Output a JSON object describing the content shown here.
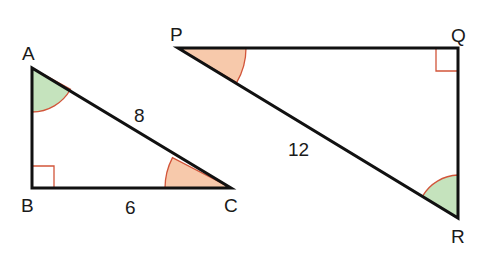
{
  "triangles": [
    {
      "name": "ABC",
      "vertices": {
        "A": "A",
        "B": "B",
        "C": "C"
      },
      "side_labels": {
        "AC": "8",
        "BC": "6"
      },
      "right_angle_at": "B",
      "marked_angles": {
        "A": "green",
        "C": "orange"
      }
    },
    {
      "name": "PQR",
      "vertices": {
        "P": "P",
        "Q": "Q",
        "R": "R"
      },
      "side_labels": {
        "PR": "12"
      },
      "right_angle_at": "Q",
      "marked_angles": {
        "P": "orange",
        "R": "green"
      }
    }
  ],
  "colors": {
    "green_angle": "#c5e3bd",
    "orange_angle": "#f7c9ab",
    "arc_stroke": "#d2553a",
    "line": "#111111"
  }
}
